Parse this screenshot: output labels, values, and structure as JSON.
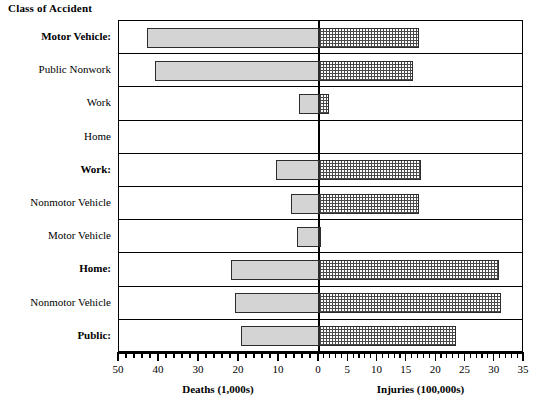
{
  "chart_data": {
    "type": "bar",
    "orientation": "horizontal",
    "title": "Class of Accident",
    "subtitle": "",
    "style": "bidirectional population pyramid",
    "grid": false,
    "legend_position": "none",
    "categories": [
      "Motor Vehicle:",
      "Public Nonwork",
      "Work",
      "Home",
      "Work:",
      "Nonmotor Vehicle",
      "Motor Vehicle",
      "Home:",
      "Nonmotor  Vehicle",
      "Public:"
    ],
    "category_emphasis": [
      true,
      false,
      false,
      false,
      true,
      false,
      false,
      true,
      false,
      true
    ],
    "series": [
      {
        "name": "Deaths  (1,000s)",
        "side": "left",
        "axis_label": "Deaths  (1,000s)",
        "units": "thousands",
        "axis_max": 50,
        "axis_min": 0,
        "tick_labels": [
          "50",
          "40",
          "30",
          "20",
          "10",
          "0"
        ],
        "tick_values": [
          50,
          40,
          30,
          20,
          10,
          0
        ],
        "minor_tick_step": 2,
        "values": [
          43,
          41,
          5,
          0,
          10.7,
          7,
          5.4,
          22,
          21,
          19.4
        ]
      },
      {
        "name": "Injuries  (100,000s)",
        "side": "right",
        "axis_label": "Injuries  (100,000s)",
        "units": "hundred thousands",
        "axis_min": 0,
        "axis_max": 35,
        "tick_labels": [
          "0",
          "5",
          "10",
          "15",
          "20",
          "25",
          "30",
          "35"
        ],
        "tick_values": [
          0,
          5,
          10,
          15,
          20,
          25,
          30,
          35
        ],
        "minor_tick_step": 1,
        "values": [
          17,
          16,
          1.7,
          0,
          17.4,
          17,
          0.4,
          30.7,
          31,
          23.4
        ]
      }
    ],
    "xlabel_left": "Deaths  (1,000s)",
    "xlabel_right": "Injuries  (100,000s)",
    "ylabel": "Class of Accident",
    "colors": {
      "deaths_fill": "#d4d4d4",
      "injuries_fill": "#ffffff",
      "injuries_hatch": "#4a4a4a",
      "bar_border": "#2c2c2c",
      "frame": "#000000",
      "background": "#ffffff"
    }
  },
  "axis": {
    "left_caption": "Deaths  (1,000s)",
    "right_caption": "Injuries  (100,000s)"
  }
}
